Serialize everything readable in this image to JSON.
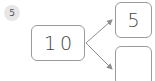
{
  "problem": {
    "number": "5"
  },
  "number_bond": {
    "whole": "10",
    "parts": [
      {
        "value": "5"
      },
      {
        "value": ""
      }
    ]
  },
  "colors": {
    "border": "#9a9a9a",
    "arrow": "#8c8c8c",
    "badge_bg": "#e6e6e6",
    "text": "#444444"
  }
}
